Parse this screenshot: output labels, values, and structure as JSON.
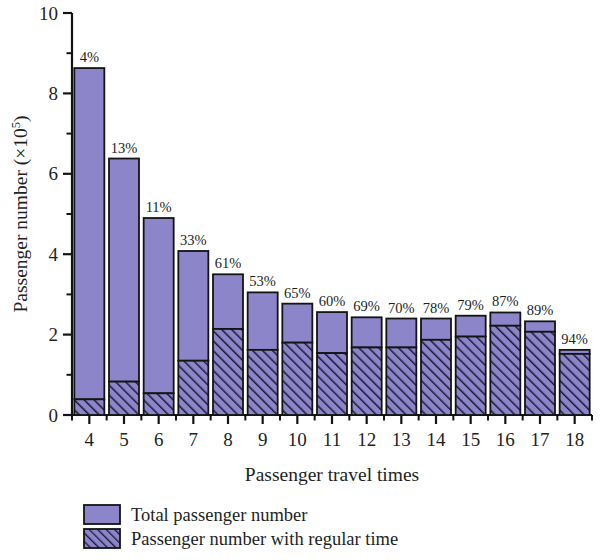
{
  "chart_data": {
    "type": "bar",
    "stacked": true,
    "title": "",
    "subtitle": "",
    "xlabel": "Passenger travel times",
    "ylabel": "Passenger number (×10⁵)",
    "ylabel_base": "Passenger number (×10",
    "ylabel_exp": "5",
    "ylabel_tail": ")",
    "categories": [
      "4",
      "5",
      "6",
      "7",
      "8",
      "9",
      "10",
      "11",
      "12",
      "13",
      "14",
      "15",
      "16",
      "17",
      "18"
    ],
    "x_tick_labels": [
      "4",
      "5",
      "6",
      "7",
      "8",
      "9",
      "10",
      "11",
      "12",
      "13",
      "14",
      "15",
      "16",
      "17",
      "18"
    ],
    "y_tick_labels": [
      "0",
      "2",
      "4",
      "6",
      "8",
      "10"
    ],
    "y_tick_values": [
      0,
      2,
      4,
      6,
      8,
      10
    ],
    "ylim": [
      0,
      10
    ],
    "y_minor_ticks": [
      1,
      3,
      5,
      7,
      9
    ],
    "grid": false,
    "legend_position": "bottom-left",
    "series": [
      {
        "name": "Total passenger number",
        "pattern": "solid",
        "color": "#8d85c9",
        "values": [
          8.63,
          6.38,
          4.9,
          4.08,
          3.5,
          3.05,
          2.77,
          2.56,
          2.43,
          2.4,
          2.4,
          2.47,
          2.55,
          2.33,
          1.62
        ]
      },
      {
        "name": "Passenger number with regular time",
        "pattern": "diagonal-hatch",
        "color": "#8d85c9",
        "hatch_color": "#1b1b3a",
        "values": [
          0.39,
          0.83,
          0.54,
          1.35,
          2.14,
          1.62,
          1.8,
          1.54,
          1.68,
          1.68,
          1.87,
          1.95,
          2.22,
          2.07,
          1.52
        ]
      }
    ],
    "data_labels": [
      "4%",
      "13%",
      "11%",
      "33%",
      "61%",
      "53%",
      "65%",
      "60%",
      "69%",
      "70%",
      "78%",
      "79%",
      "87%",
      "89%",
      "94%"
    ],
    "data_label_values": [
      4,
      13,
      11,
      33,
      61,
      53,
      65,
      60,
      69,
      70,
      78,
      79,
      87,
      89,
      94
    ],
    "data_label_meaning": "share of total passenger number travelling with regular time"
  },
  "legend": {
    "items": [
      {
        "label": "Total passenger number",
        "swatch": "solid"
      },
      {
        "label": "Passenger number with regular time",
        "swatch": "hatched"
      }
    ]
  },
  "colors": {
    "bar_fill": "#8d85c9",
    "bar_edge": "#141414",
    "hatch": "#191935",
    "axis": "#141414",
    "text": "#221f1f",
    "background": "#ffffff"
  }
}
